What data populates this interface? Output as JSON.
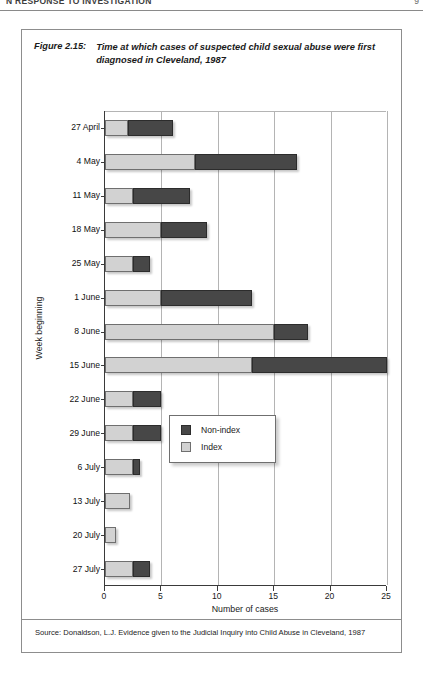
{
  "page": {
    "running_head": "N RESPONSE TO INVESTIGATION",
    "page_number": "9"
  },
  "figure": {
    "label": "Figure 2.15:",
    "title": "Time at which cases of suspected child sexual abuse were first diagnosed in Cleveland, 1987",
    "source": "Source: Donaldson, L.J. Evidence given to the Judicial Inquiry into Child Abuse in Cleveland, 1987"
  },
  "colors": {
    "index": "#d2d2d2",
    "nonindex": "#474747",
    "axis": "#3a3a3a",
    "grid": "#b4b4b4",
    "frame": "#8d8d8d"
  },
  "chart_data": {
    "type": "bar",
    "orientation": "horizontal",
    "stacked": true,
    "title": "Time at which cases of suspected child sexual abuse were first diagnosed in Cleveland, 1987",
    "xlabel": "Number of cases",
    "ylabel": "Week beginning",
    "xlim": [
      0,
      25
    ],
    "xticks": [
      0,
      5,
      10,
      15,
      20,
      25
    ],
    "grid": "vertical",
    "legend_position": "inside-lower-right",
    "categories": [
      "27 April",
      "4 May",
      "11 May",
      "18 May",
      "25 May",
      "1 June",
      "8 June",
      "15 June",
      "22 June",
      "29 June",
      "6 July",
      "13 July",
      "20 July",
      "27 July"
    ],
    "series": [
      {
        "name": "Index",
        "color": "#d2d2d2",
        "values": [
          2,
          8,
          2.5,
          5,
          2.5,
          5,
          15,
          13,
          2.5,
          2.5,
          2.5,
          2.2,
          1,
          2.5
        ]
      },
      {
        "name": "Non-index",
        "color": "#474747",
        "values": [
          4,
          9,
          5,
          4,
          1.5,
          8,
          3,
          12,
          2.5,
          2.5,
          0.6,
          0,
          0,
          1.5
        ]
      }
    ],
    "totals": [
      6,
      17,
      7.5,
      9,
      4,
      13,
      18,
      25,
      5,
      5,
      3.1,
      2.2,
      1,
      4
    ]
  }
}
